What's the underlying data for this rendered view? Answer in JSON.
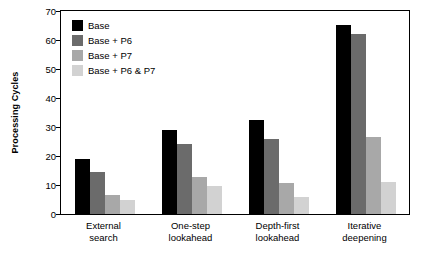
{
  "chart_data": {
    "type": "bar",
    "title": "",
    "xlabel": "",
    "ylabel": "Processing Cycles",
    "ylim": [
      0,
      70
    ],
    "yticks": [
      0,
      10,
      20,
      30,
      40,
      50,
      60,
      70
    ],
    "grid": false,
    "legend_position": "top-left inside plot",
    "categories": [
      "External\nsearch",
      "One-step\nlookahead",
      "Depth-first\nlookahead",
      "Iterative\ndeepening"
    ],
    "category_lines": [
      [
        "External",
        "search"
      ],
      [
        "One-step",
        "lookahead"
      ],
      [
        "Depth-first",
        "lookahead"
      ],
      [
        "Iterative",
        "deepening"
      ]
    ],
    "series": [
      {
        "name": "Base",
        "color": "#000000",
        "values": [
          18.8,
          29.0,
          32.3,
          65.3
        ]
      },
      {
        "name": "Base + P6",
        "color": "#6b6b6b",
        "values": [
          14.5,
          24.0,
          25.7,
          62.0
        ]
      },
      {
        "name": "Base + P7",
        "color": "#a8a8a8",
        "values": [
          6.7,
          12.8,
          10.8,
          26.5
        ]
      },
      {
        "name": "Base + P6 & P7",
        "color": "#d2d2d2",
        "values": [
          4.8,
          9.7,
          5.9,
          11.0
        ]
      }
    ]
  },
  "legend": {
    "items": [
      {
        "label": "Base"
      },
      {
        "label": "Base + P6"
      },
      {
        "label": "Base + P7"
      },
      {
        "label": "Base + P6 & P7"
      }
    ]
  },
  "axis": {
    "y_label": "Processing Cycles",
    "y_ticks": [
      "0",
      "10",
      "20",
      "30",
      "40",
      "50",
      "60",
      "70"
    ]
  }
}
